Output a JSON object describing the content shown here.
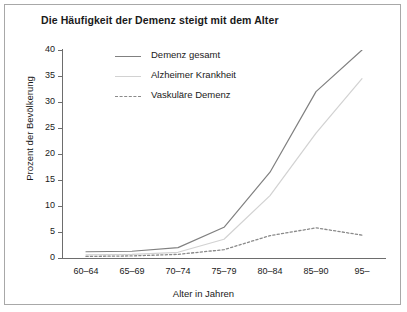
{
  "chart_data": {
    "type": "line",
    "title": "Die Häufigkeit der Demenz steigt mit dem Alter",
    "xlabel": "Alter in Jahren",
    "ylabel": "Prozent der Bevölkerung",
    "categories": [
      "60–64",
      "65–69",
      "70–74",
      "75–79",
      "80–84",
      "85–90",
      "95–"
    ],
    "yticks": [
      0,
      5,
      10,
      15,
      20,
      25,
      30,
      35,
      40
    ],
    "ylim": [
      0,
      40
    ],
    "grid": false,
    "legend_position": "top-center",
    "series": [
      {
        "name": "Demenz gesamt",
        "style": "solid",
        "color": "#808080",
        "values": [
          1.2,
          1.3,
          2.0,
          5.9,
          16.5,
          32.0,
          40.0
        ]
      },
      {
        "name": "Alzheimer Krankheit",
        "style": "solid",
        "color": "#d2d2d2",
        "values": [
          0.6,
          0.7,
          1.1,
          3.6,
          12.0,
          24.0,
          34.5
        ]
      },
      {
        "name": "Vaskuläre Demenz",
        "style": "dashed",
        "color": "#8a8a8a",
        "values": [
          0.3,
          0.4,
          0.7,
          1.6,
          4.3,
          5.8,
          4.4
        ]
      }
    ]
  }
}
